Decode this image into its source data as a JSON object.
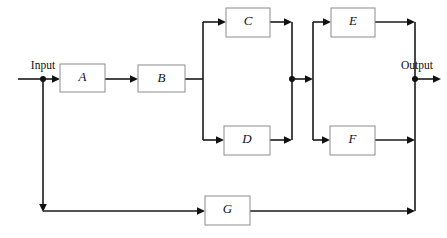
{
  "diagram": {
    "type": "block-diagram",
    "canvas": {
      "width": 447,
      "height": 238,
      "background": "#ffffff"
    },
    "colors": {
      "wire": "#1a1a1a",
      "block_border": "#8c8c8c",
      "block_fill": "#ffffff",
      "text": "#111111",
      "node": "#111111"
    },
    "labels": {
      "input": "Input",
      "output": "Output"
    },
    "blocks": [
      {
        "id": "A",
        "label": "A",
        "x": 60,
        "y": 64,
        "w": 45,
        "h": 28
      },
      {
        "id": "B",
        "label": "B",
        "x": 138,
        "y": 65,
        "w": 47,
        "h": 27
      },
      {
        "id": "C",
        "label": "C",
        "x": 226,
        "y": 8,
        "w": 44,
        "h": 29
      },
      {
        "id": "D",
        "label": "D",
        "x": 224,
        "y": 126,
        "w": 46,
        "h": 29
      },
      {
        "id": "E",
        "label": "E",
        "x": 331,
        "y": 8,
        "w": 44,
        "h": 29
      },
      {
        "id": "F",
        "label": "F",
        "x": 330,
        "y": 126,
        "w": 45,
        "h": 29
      },
      {
        "id": "G",
        "label": "G",
        "x": 205,
        "y": 196,
        "w": 45,
        "h": 29
      }
    ],
    "nodes": [
      {
        "id": "input-junction",
        "x": 43,
        "y": 79
      },
      {
        "id": "middle-junction",
        "x": 292,
        "y": 79
      },
      {
        "id": "output-junction",
        "x": 415,
        "y": 79
      }
    ],
    "connections": [
      {
        "id": "input-to-junction",
        "from": "input",
        "to": "input-junction"
      },
      {
        "id": "junction-to-a",
        "from": "input-junction",
        "to": "A"
      },
      {
        "id": "a-to-b",
        "from": "A",
        "to": "B"
      },
      {
        "id": "b-to-split-cd",
        "from": "B",
        "to": "split-cd"
      },
      {
        "id": "split-cd-to-c",
        "from": "split-cd",
        "to": "C"
      },
      {
        "id": "split-cd-to-d",
        "from": "split-cd",
        "to": "D"
      },
      {
        "id": "c-to-merge-cd",
        "from": "C",
        "to": "merge-cd"
      },
      {
        "id": "d-to-merge-cd",
        "from": "D",
        "to": "merge-cd"
      },
      {
        "id": "merge-cd-to-split-ef",
        "from": "middle-junction",
        "to": "split-ef"
      },
      {
        "id": "split-ef-to-e",
        "from": "split-ef",
        "to": "E"
      },
      {
        "id": "split-ef-to-f",
        "from": "split-ef",
        "to": "F"
      },
      {
        "id": "e-to-merge-ef",
        "from": "E",
        "to": "merge-ef"
      },
      {
        "id": "f-to-merge-ef",
        "from": "F",
        "to": "merge-ef"
      },
      {
        "id": "merge-ef-to-output",
        "from": "output-junction",
        "to": "output"
      },
      {
        "id": "feedback-down",
        "from": "input-junction",
        "to": "feedback-bus"
      },
      {
        "id": "feedback-to-g",
        "from": "feedback-bus",
        "to": "G"
      },
      {
        "id": "g-to-output-junction",
        "from": "G",
        "to": "output-junction"
      }
    ]
  }
}
